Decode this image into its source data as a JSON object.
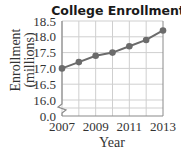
{
  "chart_data": {
    "type": "line",
    "title": "College Enrollment",
    "xlabel": "Year",
    "ylabel": "Enrollment (millions)",
    "ylabel_lines": [
      "Enrollment",
      "(millions)"
    ],
    "x": [
      2007,
      2008,
      2009,
      2010,
      2011,
      2012,
      2013
    ],
    "values": [
      17.0,
      17.2,
      17.4,
      17.5,
      17.7,
      17.9,
      18.2
    ],
    "x_tick_labels": [
      "2007",
      "2009",
      "2011",
      "2013"
    ],
    "y_tick_labels": [
      "18.5",
      "18.0",
      "17.5",
      "17.0",
      "16.5",
      "16.0",
      "0.0"
    ],
    "ylim": [
      16.0,
      18.5
    ],
    "y_axis_break": true,
    "grid": true,
    "legend": null,
    "colors": {
      "line": "#6b6b6b",
      "marker": "#6b6b6b",
      "grid": "#cfcfcf",
      "axis": "#8a8a8a"
    }
  }
}
